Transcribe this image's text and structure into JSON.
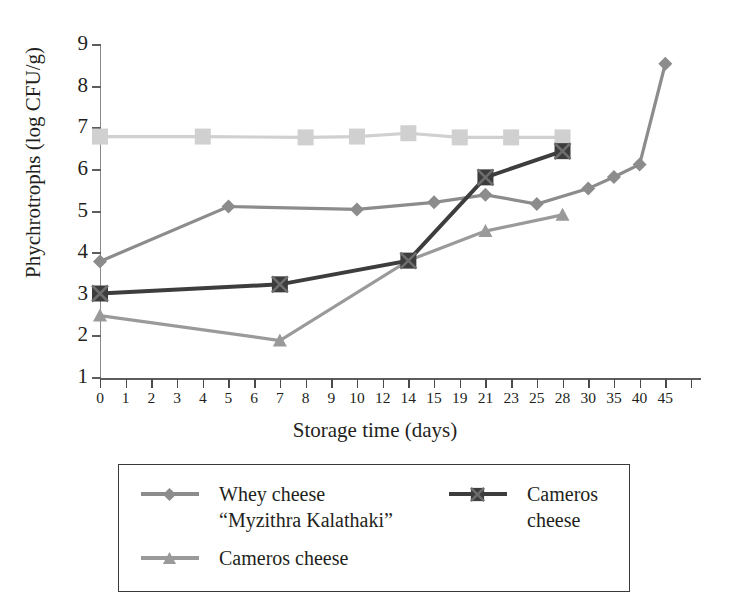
{
  "chart_data": {
    "type": "line",
    "title": "",
    "xlabel": "Storage time (days)",
    "ylabel": "Phychrotrophs (log CFU/g)",
    "ylim": [
      1,
      9
    ],
    "yticks": [
      "9",
      "8",
      "7",
      "6",
      "5",
      "4",
      "3",
      "2",
      "1"
    ],
    "categories": [
      "0",
      "1",
      "2",
      "3",
      "4",
      "5",
      "6",
      "7",
      "8",
      "9",
      "10",
      "12",
      "14",
      "15",
      "19",
      "21",
      "23",
      "25",
      "28",
      "30",
      "35",
      "40",
      "45"
    ],
    "grid": false,
    "legend_position": "below-plot",
    "series": [
      {
        "name": "light-gray-squares",
        "legend_label": "",
        "marker": "square",
        "color": "#d0d0d0",
        "x": [
          "0",
          "4",
          "8",
          "10",
          "14",
          "19",
          "23",
          "28"
        ],
        "values": [
          6.8,
          6.8,
          6.78,
          6.8,
          6.88,
          6.78,
          6.78,
          6.78
        ]
      },
      {
        "name": "whey-cheese-myzithra-kalathaki",
        "legend_label": "Whey cheese\n“Myzithra Kalathaki”",
        "marker": "diamond",
        "color": "#8c8c8c",
        "x": [
          "0",
          "5",
          "10",
          "15",
          "21",
          "25",
          "30",
          "35",
          "40",
          "45"
        ],
        "values": [
          3.8,
          5.12,
          5.05,
          5.22,
          5.4,
          5.18,
          5.55,
          5.83,
          6.13,
          8.55
        ]
      },
      {
        "name": "cameros-cheese-triangle",
        "legend_label": "Cameros cheese",
        "marker": "triangle",
        "color": "#9a9a9a",
        "x": [
          "0",
          "7",
          "14",
          "21",
          "28"
        ],
        "values": [
          2.5,
          1.9,
          3.82,
          4.53,
          4.92
        ]
      },
      {
        "name": "cameros-cheese-cross",
        "legend_label": "Cameros cheese",
        "marker": "cross-square",
        "color": "#3d3d3d",
        "x": [
          "0",
          "7",
          "14",
          "21",
          "28"
        ],
        "values": [
          3.03,
          3.25,
          3.82,
          5.82,
          6.45
        ]
      }
    ]
  },
  "legend": {
    "entries": [
      {
        "label": "Whey cheese\n“Myzithra Kalathaki”",
        "marker": "diamond",
        "color": "#8c8c8c"
      },
      {
        "label": "Cameros cheese",
        "marker": "cross-square",
        "color": "#3d3d3d"
      },
      {
        "label": "Cameros cheese",
        "marker": "triangle",
        "color": "#9a9a9a"
      }
    ]
  },
  "colors": {
    "axis": "#5d5d5d",
    "text": "#231f20",
    "series_light_square": "#d0d0d0",
    "series_diamond": "#8c8c8c",
    "series_triangle": "#9a9a9a",
    "series_cross": "#3d3d3d",
    "legend_border": "#3a3a3a",
    "background": "#ffffff"
  }
}
